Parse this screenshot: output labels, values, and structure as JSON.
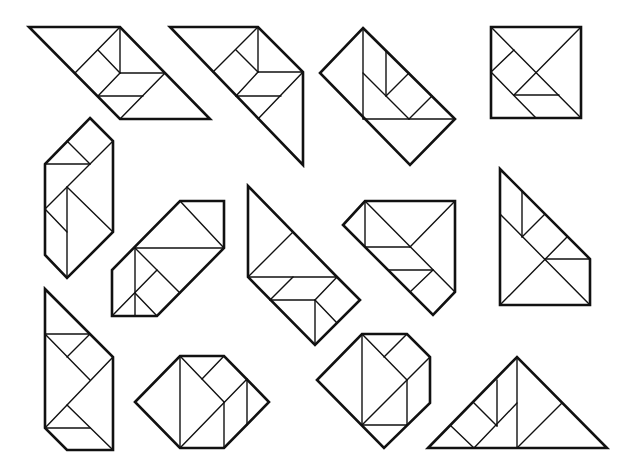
{
  "figure": {
    "title": "",
    "colors": {
      "background": "#ffffff",
      "stroke": "#111111"
    }
  },
  "shapes": [
    {
      "id": "parallelogram-left",
      "outline": "29,27 120,27 210,119 120,119",
      "lines": [
        "120,27 120,73",
        "120,73 165,73",
        "120,27 75,73",
        "98,50 120,73",
        "120,73 98,96",
        "98,96 143,96",
        "165,73 120,119"
      ]
    },
    {
      "id": "trapezoid-tail",
      "outline": "170,27 258,27 303,72 303,165",
      "lines": [
        "258,27 258,72",
        "258,72 303,72",
        "258,27 213,72",
        "236,50 258,72",
        "258,72 236,96",
        "236,96 281,96",
        "303,72 258,119"
      ]
    },
    {
      "id": "rectangle-diagonal",
      "outline": "363,28 455,119 410,165 320,73",
      "lines": [
        "363,28 363,119",
        "363,119 455,119",
        "386,51 386,96",
        "363,73 409,119",
        "386,96 409,73",
        "409,119 432,96"
      ]
    },
    {
      "id": "square",
      "outline": "491,27 581,27 581,118 491,118",
      "lines": [
        "491,27 581,118",
        "581,27 514,95",
        "491,72 514,50",
        "491,72 536,118",
        "514,95 559,95"
      ]
    },
    {
      "id": "hexagon-tall-left",
      "outline": "90,118 113,141 113,232 67,278 45,255 45,164",
      "lines": [
        "45,164 90,164",
        "67,141 90,164",
        "113,141 45,209",
        "67,187 67,278",
        "67,187 113,232",
        "45,209 67,232"
      ]
    },
    {
      "id": "hexagon-slanted",
      "outline": "180,201 224,201 224,248 157,316 112,316 112,270",
      "lines": [
        "180,201 224,248",
        "135,248 224,248",
        "135,248 135,316",
        "135,248 180,293",
        "157,270 112,316",
        "135,293 157,316"
      ]
    },
    {
      "id": "kite-triangle",
      "outline": "248,186 337,277 360,300 315,345 248,277",
      "lines": [
        "248,277 337,277",
        "248,277 293,232",
        "270,300 293,277",
        "270,300 315,300",
        "315,300 315,345",
        "315,300 337,323",
        "315,300 337,277"
      ]
    },
    {
      "id": "pentagon-right",
      "outline": "365,201 455,201 455,292 433,315 343,225",
      "lines": [
        "365,201 365,247",
        "365,201 455,292",
        "365,247 410,247",
        "455,201 410,247",
        "388,270 433,270",
        "410,292 433,270"
      ]
    },
    {
      "id": "right-trapezoid",
      "outline": "500,169 590,259 590,305 500,305",
      "lines": [
        "500,214 590,305",
        "500,305 567,237",
        "522,191 522,237",
        "522,237 545,214",
        "545,259 590,259"
      ]
    },
    {
      "id": "tall-lower-left",
      "outline": "45,289 113,357 113,450 67,450 45,428",
      "lines": [
        "45,334 90,334",
        "45,334 90,380",
        "67,357 90,334",
        "113,357 45,428",
        "45,428 90,428",
        "67,405 113,450"
      ]
    },
    {
      "id": "hexagon-bottom",
      "outline": "135,402 180,356 224,356 269,402 224,448 180,448",
      "lines": [
        "180,356 180,448",
        "180,356 224,402",
        "202,379 224,356",
        "180,448 247,379",
        "224,402 224,448",
        "247,379 247,425"
      ]
    },
    {
      "id": "irregular-bottom-mid",
      "outline": "317,380 362,334 407,334 430,357 430,403 384,448",
      "lines": [
        "362,334 362,425",
        "362,334 407,380",
        "384,357 407,334",
        "362,425 430,357",
        "407,380 407,425",
        "362,425 407,425"
      ]
    },
    {
      "id": "big-triangle",
      "outline": "428,448 517,357 607,448",
      "lines": [
        "517,357 517,448",
        "517,448 562,403",
        "474,403 497,426",
        "497,426 497,380",
        "474,448 517,403",
        "451,426 474,448"
      ]
    }
  ]
}
